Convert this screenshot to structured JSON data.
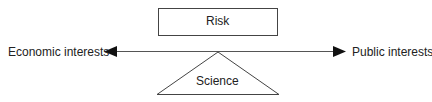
{
  "diagram": {
    "top_box": {
      "label": "Risk"
    },
    "fulcrum": {
      "label": "Science"
    },
    "left_end": {
      "label": "Economic interests"
    },
    "right_end": {
      "label": "Public interests"
    },
    "colors": {
      "stroke": "#333333",
      "text": "#222222"
    }
  }
}
